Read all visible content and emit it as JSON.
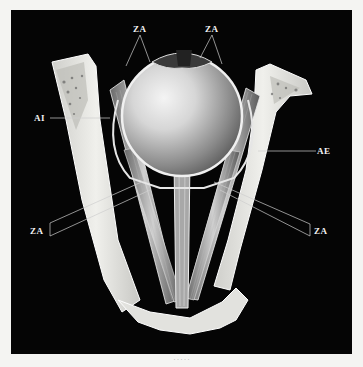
{
  "figure": {
    "labels": {
      "za_top_left": "ZA",
      "za_top_right": "ZA",
      "ai": "AI",
      "ae": "AE",
      "za_mid_left": "ZA",
      "za_mid_right": "ZA"
    },
    "caption": "· · · · ·"
  },
  "colors": {
    "background": "#050505",
    "page": "#f4f4f2",
    "bone": "#e8e8e4",
    "label": "#f2f2f2"
  }
}
